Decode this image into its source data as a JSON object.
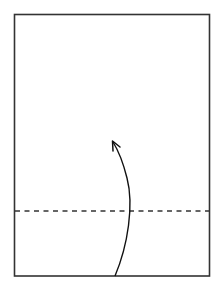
{
  "diagram": {
    "type": "fold-instruction",
    "paper": {
      "x": 14,
      "y": 14,
      "width": 195,
      "height": 262,
      "stroke": "#333333"
    },
    "fold_line": {
      "style": "dashed",
      "orientation": "horizontal",
      "y": 211,
      "stroke": "#333333"
    },
    "arrow": {
      "direction": "up",
      "start": [
        115,
        276
      ],
      "end": [
        113,
        141
      ],
      "stroke": "#111111",
      "meaning": "fold bottom edge up along dashed valley line"
    }
  }
}
